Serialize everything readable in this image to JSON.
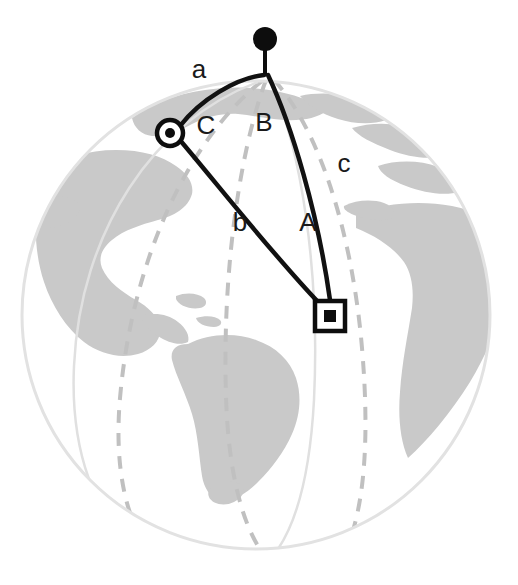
{
  "figure": {
    "background_color": "#ffffff"
  },
  "colors": {
    "land_fill": "#c9c9c9",
    "ocean_fill": "#ffffff",
    "globe_outline": "#e2e2e2",
    "meridian_dashed": "#c0c0c0",
    "triangle_stroke": "#111111",
    "marker_fill": "#0d0d0d",
    "label_text": "#1a1a1a",
    "ghost_text": "#f4f4f4"
  },
  "globe": {
    "center_x": 256,
    "center_y": 315,
    "radius": 234,
    "outline_label": "globe-limb"
  },
  "markers": [
    {
      "id": "pole",
      "name": "north-pole-marker",
      "shape": "filled-circle-on-stalk",
      "x": 265,
      "y": 39,
      "anchor_x": 265,
      "anchor_y": 74,
      "radius": 11
    },
    {
      "id": "vertex-c",
      "name": "observer-vertex-marker",
      "shape": "ringed-dot",
      "x": 170,
      "y": 133,
      "outer_radius": 13,
      "inner_radius": 5
    },
    {
      "id": "vertex-a",
      "name": "target-vertex-marker",
      "shape": "square-in-square",
      "x": 330,
      "y": 316,
      "outer_size": 28,
      "inner_size": 11
    }
  ],
  "triangle": {
    "name": "spherical-triangle",
    "vertices": [
      {
        "label": "pole",
        "x": 265,
        "y": 74
      },
      {
        "label": "C",
        "x": 170,
        "y": 133
      },
      {
        "label": "A",
        "x": 330,
        "y": 316
      }
    ],
    "sides": [
      {
        "id": "a",
        "label": "a",
        "from": "pole",
        "to": "C",
        "label_x": 199,
        "label_y": 71
      },
      {
        "id": "b",
        "label": "b",
        "from": "C",
        "to": "A",
        "label_x": 240,
        "label_y": 224
      },
      {
        "id": "c",
        "label": "c",
        "from": "pole",
        "to": "A",
        "label_x": 344,
        "label_y": 165
      }
    ],
    "angles": [
      {
        "id": "A",
        "label": "A",
        "at_vertex": "A",
        "label_x": 308,
        "label_y": 224
      },
      {
        "id": "B",
        "label": "B",
        "at_vertex": "pole",
        "label_x": 264,
        "label_y": 124
      },
      {
        "id": "C",
        "label": "C",
        "at_vertex": "C",
        "label_x": 206,
        "label_y": 127
      }
    ]
  },
  "meridians": [
    {
      "id": "meridian-1",
      "name": "dashed-meridian-left"
    },
    {
      "id": "meridian-2",
      "name": "dashed-meridian-center"
    },
    {
      "id": "meridian-3",
      "name": "dashed-meridian-right"
    },
    {
      "id": "meridian-4",
      "name": "solid-faint-meridian"
    }
  ],
  "landmasses": [
    {
      "id": "north-america",
      "name": "landmass-north-america"
    },
    {
      "id": "south-america",
      "name": "landmass-south-america"
    },
    {
      "id": "greenland",
      "name": "landmass-greenland"
    },
    {
      "id": "europe",
      "name": "landmass-europe"
    },
    {
      "id": "africa",
      "name": "landmass-africa"
    }
  ],
  "ghost_text": {
    "line1": "",
    "line2": ""
  }
}
